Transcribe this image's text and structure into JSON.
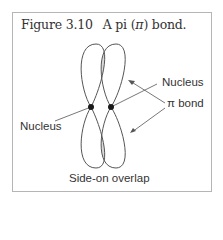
{
  "figure": {
    "number": "Figure 3.10",
    "title_prefix": "A pi (",
    "title_symbol": "π",
    "title_suffix": ") bond."
  },
  "labels": {
    "nucleus_left": "Nucleus",
    "nucleus_right": "Nucleus",
    "pi_bond": "π bond",
    "overlap": "Side-on overlap"
  },
  "colors": {
    "line": "#555555",
    "overlap_fill": "#d9d9d9",
    "nucleus": "#1a1a1a",
    "frame": "#b5b5b5"
  }
}
